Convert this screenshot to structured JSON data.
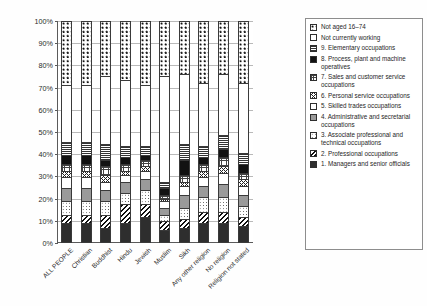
{
  "chart_data": {
    "type": "bar",
    "subtype": "100% stacked column",
    "title": "",
    "xlabel": "",
    "ylabel": "",
    "ylim": [
      0,
      100
    ],
    "y_unit": "%",
    "grid": true,
    "legend_position": "right",
    "yticks": [
      "0%",
      "10%",
      "20%",
      "30%",
      "40%",
      "50%",
      "60%",
      "70%",
      "80%",
      "90%",
      "100%"
    ],
    "ytick_values": [
      0,
      10,
      20,
      30,
      40,
      50,
      60,
      70,
      80,
      90,
      100
    ],
    "categories": [
      "ALL PEOPLE",
      "Christian",
      "Buddhist",
      "Hindu",
      "Jewish",
      "Muslim",
      "Sikh",
      "Any other religion",
      "No religion",
      "Religion not stated"
    ],
    "series": [
      {
        "name": "1. Managers and senior officials",
        "key": "managers",
        "values": [
          8,
          8,
          6,
          8,
          11,
          5,
          6,
          8,
          8,
          7
        ]
      },
      {
        "name": "2. Professional occupations",
        "key": "professional",
        "values": [
          4,
          4,
          6,
          9,
          6,
          4,
          4,
          5,
          5,
          4
        ]
      },
      {
        "name": "3. Associate professional and technical occupations",
        "key": "associate",
        "values": [
          6,
          6,
          6,
          5,
          6,
          3,
          5,
          7,
          7,
          5
        ]
      },
      {
        "name": "4. Administrative and secretarial occupations",
        "key": "admin",
        "values": [
          6,
          6,
          5,
          5,
          5,
          3,
          6,
          5,
          6,
          5
        ]
      },
      {
        "name": "5. Skilled trades occupations",
        "key": "skilled",
        "values": [
          5,
          5,
          4,
          3,
          4,
          3,
          4,
          4,
          5,
          4
        ]
      },
      {
        "name": "6. Personal service occupations",
        "key": "personal",
        "values": [
          3,
          3,
          3,
          2,
          2,
          1,
          2,
          3,
          3,
          3
        ]
      },
      {
        "name": "7. Sales and customer service occupations",
        "key": "sales",
        "values": [
          3,
          3,
          4,
          3,
          3,
          2,
          3,
          3,
          4,
          3
        ]
      },
      {
        "name": "8. Process, plant and machine operatives",
        "key": "process",
        "values": [
          4,
          4,
          3,
          3,
          2,
          3,
          7,
          3,
          4,
          4
        ]
      },
      {
        "name": "9. Elementary occupations",
        "key": "elementary",
        "values": [
          6,
          6,
          7,
          5,
          4,
          3,
          7,
          5,
          6,
          5
        ]
      },
      {
        "name": "Not currently working",
        "key": "notworking",
        "values": [
          26,
          26,
          31,
          30,
          28,
          48,
          32,
          29,
          28,
          32
        ]
      },
      {
        "name": "Not aged 16–74",
        "key": "notaged",
        "values": [
          29,
          29,
          25,
          27,
          29,
          25,
          24,
          28,
          24,
          28
        ]
      }
    ],
    "legend_entries": [
      {
        "label": "Not aged 16–74",
        "key": "notaged",
        "pattern": "dot-star"
      },
      {
        "label": "Not currently working",
        "key": "notworking",
        "pattern": "blank"
      },
      {
        "label": "9. Elementary occupations",
        "key": "elementary",
        "pattern": "horizontal-lines"
      },
      {
        "label": "8. Process, plant and machine operatives",
        "key": "process",
        "pattern": "solid-black"
      },
      {
        "label": "7. Sales and customer service occupations",
        "key": "sales",
        "pattern": "fine-grid"
      },
      {
        "label": "6. Personal service occupations",
        "key": "personal",
        "pattern": "cross-hatch"
      },
      {
        "label": "5. Skilled trades occupations",
        "key": "skilled",
        "pattern": "blank"
      },
      {
        "label": "4. Administrative and secretarial occupations",
        "key": "admin",
        "pattern": "solid-grey"
      },
      {
        "label": "3. Associate professional and technical occupations",
        "key": "associate",
        "pattern": "sparse-dots"
      },
      {
        "label": "2. Professional occupations",
        "key": "professional",
        "pattern": "diagonal-stripes"
      },
      {
        "label": "1. Managers and senior officials",
        "key": "managers",
        "pattern": "solid-dark"
      }
    ],
    "colors": {
      "axis": "#5a5a5a",
      "gridline": "#b9b9b9",
      "text": "#2b2b2b",
      "solid_black": "#121212",
      "solid_dark": "#2e2e2e",
      "solid_grey": "#9a9a9a",
      "background": "#ffffff"
    }
  }
}
